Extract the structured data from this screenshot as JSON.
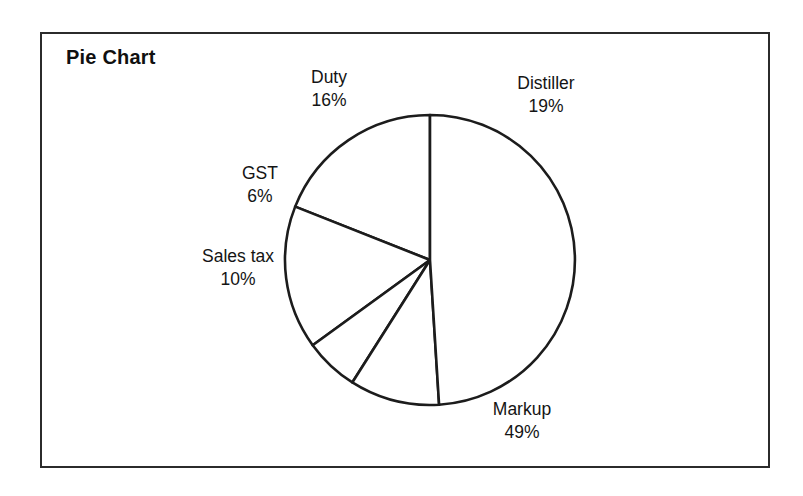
{
  "chart": {
    "title": "Pie Chart",
    "frame_color": "#2b2b2b",
    "slice_stroke_color": "#1c1c1c",
    "slice_fill_color": "#ffffff"
  },
  "chart_data": {
    "type": "pie",
    "title": "Pie Chart",
    "xlabel": "",
    "ylabel": "",
    "legend": "none",
    "grid": false,
    "start_angle_deg": 90,
    "direction": "counterclockwise",
    "categories": [
      "Distiller",
      "Duty",
      "GST",
      "Sales tax",
      "Markup"
    ],
    "values": [
      19,
      16,
      6,
      10,
      49
    ],
    "unit": "%",
    "slices": [
      {
        "label": "Distiller",
        "percent": 19,
        "percent_text": "19%"
      },
      {
        "label": "Duty",
        "percent": 16,
        "percent_text": "16%"
      },
      {
        "label": "GST",
        "percent": 6,
        "percent_text": "6%"
      },
      {
        "label": "Sales tax",
        "percent": 10,
        "percent_text": "10%"
      },
      {
        "label": "Markup",
        "percent": 49,
        "percent_text": "49%"
      }
    ],
    "total_percent": 100
  }
}
